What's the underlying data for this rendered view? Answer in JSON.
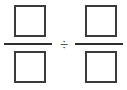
{
  "canvas": {
    "width": 127,
    "height": 90,
    "background_color": "#ffffff"
  },
  "expression": {
    "kind": "fraction-division",
    "operator": {
      "name": "division-sign",
      "glyph": "÷",
      "color": "#2e2e2e"
    },
    "operands": [
      {
        "position": "left",
        "numerator": {
          "type": "empty-box",
          "value": "",
          "placeholder": "",
          "border_color": "#3b3b3b"
        },
        "denominator": {
          "type": "empty-box",
          "value": "",
          "placeholder": "",
          "border_color": "#3b3b3b"
        },
        "bar": {
          "name": "fraction-bar",
          "color": "#2e2e2e"
        }
      },
      {
        "position": "right",
        "numerator": {
          "type": "empty-box",
          "value": "",
          "placeholder": "",
          "border_color": "#3b3b3b"
        },
        "denominator": {
          "type": "empty-box",
          "value": "",
          "placeholder": "",
          "border_color": "#3b3b3b"
        },
        "bar": {
          "name": "fraction-bar",
          "color": "#2e2e2e"
        }
      }
    ]
  }
}
